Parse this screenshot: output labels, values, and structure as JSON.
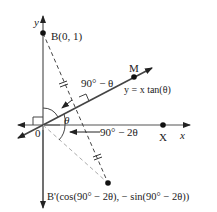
{
  "diagram": {
    "axes": {
      "x_label": "x",
      "y_label": "y",
      "origin_label": "0"
    },
    "points": {
      "B": "B(0, 1)",
      "M": "M",
      "X": "X",
      "B_prime": "B'(cos(90° − 2θ), − sin(90°  −  2θ))"
    },
    "line_label": "y = x tan(θ)",
    "angles": {
      "theta": "θ",
      "upper": "90° − θ",
      "lower": "90° − 2θ"
    },
    "colors": {
      "ink": "#222222",
      "dashed_gray": "#999999"
    }
  }
}
